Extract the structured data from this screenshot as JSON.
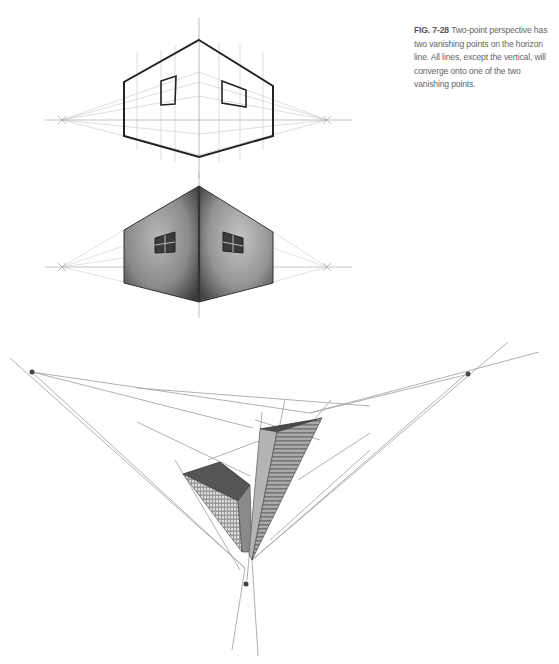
{
  "caption": {
    "label": "FIG. 7-28",
    "text": "Two-point perspective has two vanishing points on the horizon line. All lines, except the vertical, will converge onto one of the two vanishing points."
  },
  "figures": [
    {
      "name": "two-point-line-drawing",
      "description": "Outline of a box corner in two-point perspective with two windows, horizon line and construction lines to vanishing points"
    },
    {
      "name": "two-point-shaded-drawing",
      "description": "Shaded rendering of the same box corner with framed windows"
    },
    {
      "name": "three-point-buildings",
      "description": "Two skyscrapers in three-point perspective with three vanishing points"
    }
  ],
  "colors": {
    "line": "#333333",
    "guide": "#bdbdbd",
    "vanishing_point": "#444444",
    "caption_text": "#666666"
  }
}
